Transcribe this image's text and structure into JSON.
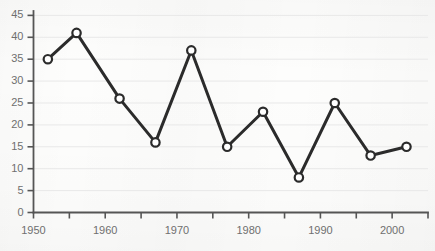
{
  "chart_data": {
    "type": "line",
    "title": "",
    "subtitle": "",
    "xlabel": "",
    "ylabel": "",
    "x": [
      1952,
      1956,
      1962,
      1967,
      1972,
      1977,
      1982,
      1987,
      1992,
      1997,
      2002
    ],
    "values": [
      35,
      41,
      26,
      16,
      37,
      15,
      23,
      8,
      25,
      13,
      15
    ],
    "series": [
      {
        "name": "series-1",
        "x": [
          1952,
          1956,
          1962,
          1967,
          1972,
          1977,
          1982,
          1987,
          1992,
          1997,
          2002
        ],
        "values": [
          35,
          41,
          26,
          16,
          37,
          15,
          23,
          8,
          25,
          13,
          15
        ]
      }
    ],
    "xlim": [
      1950,
      2005
    ],
    "ylim": [
      0,
      46
    ],
    "y_ticks": [
      0,
      5,
      10,
      15,
      20,
      25,
      30,
      35,
      40,
      45
    ],
    "y_tick_labels": [
      "0",
      "5",
      "10",
      "15",
      "20",
      "25",
      "30",
      "35",
      "40",
      "45"
    ],
    "x_major_ticks": [
      1950,
      1960,
      1970,
      1980,
      1990,
      2000
    ],
    "x_major_tick_labels": [
      "1950",
      "1960",
      "1970",
      "1980",
      "1990",
      "2000"
    ],
    "x_minor_ticks": [
      1955,
      1965,
      1975,
      1985,
      1995,
      2005
    ],
    "grid": {
      "horizontal": true,
      "vertical": false
    },
    "legend": {
      "visible": false,
      "position": "none",
      "entries": []
    },
    "marker": "open-circle",
    "annotations": [],
    "colors": {
      "line": "#2b2b2b",
      "marker_fill": "#ffffff",
      "marker_edge": "#2b2b2b",
      "gridline": "#e8e8e8",
      "axis": "#555555",
      "tick_text": "#6f6f6f",
      "background": "#fdfdfc"
    }
  }
}
